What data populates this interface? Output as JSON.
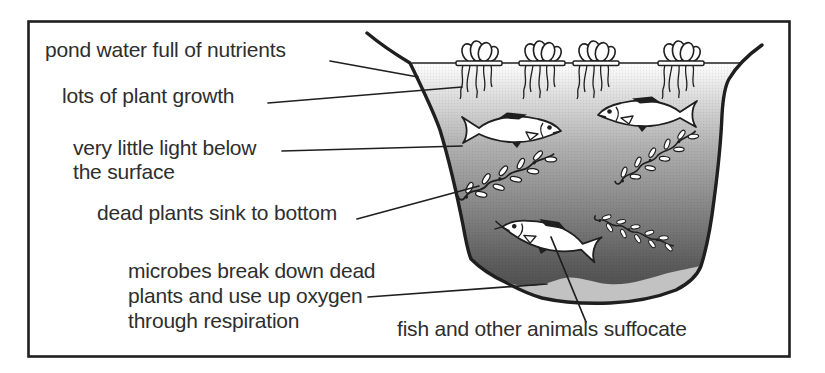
{
  "figure": {
    "type": "labelled-diagram",
    "labels": [
      {
        "text": "pond water full of nutrients"
      },
      {
        "text": "lots of plant growth"
      },
      {
        "text": "very little light below\nthe surface"
      },
      {
        "text": "dead plants sink to bottom"
      },
      {
        "text": "microbes break down dead\nplants and use up oxygen\nthrough respiration"
      },
      {
        "text": "fish and other animals suffocate"
      }
    ],
    "scene": {
      "floating_plants": 4,
      "swimming_fish": 2,
      "dead_fish": 1,
      "sinking_plant_strands": 3
    },
    "colors": {
      "ink": "#1f1f1f",
      "label_text": "#2e2e2e",
      "water_top": "#ffffff",
      "water_deep": "#4a4a4a",
      "sediment": "#c2c2c2",
      "background": "#ffffff"
    }
  }
}
